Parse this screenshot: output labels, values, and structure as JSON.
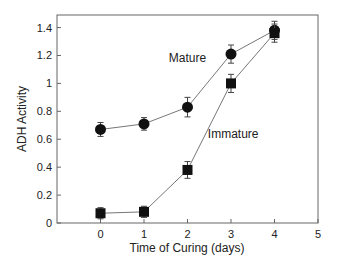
{
  "chart_data": {
    "type": "line",
    "title": "",
    "xlabel": "Time of Curing  (days)",
    "ylabel": "ADH Activity",
    "xlim": [
      -1,
      5
    ],
    "ylim": [
      0,
      1.49
    ],
    "xticks": [
      0,
      1,
      2,
      3,
      4,
      5
    ],
    "xtick_labels": [
      "0",
      "1",
      "2",
      "3",
      "4",
      "5"
    ],
    "yticks": [
      0,
      0.2,
      0.4,
      0.6,
      0.8,
      1,
      1.2,
      1.4
    ],
    "ytick_labels": [
      "0",
      "0.2",
      "0.4",
      "0.6",
      "0.8",
      "1",
      "1.2",
      "1.4"
    ],
    "grid": false,
    "x": [
      0,
      1,
      2,
      3,
      4
    ],
    "series": [
      {
        "name": "Mature",
        "marker": "circle",
        "values": [
          0.67,
          0.71,
          0.83,
          1.21,
          1.38
        ],
        "errors": [
          0.05,
          0.045,
          0.07,
          0.065,
          0.065
        ]
      },
      {
        "name": "Immature",
        "marker": "square",
        "values": [
          0.07,
          0.08,
          0.38,
          1.0,
          1.36
        ],
        "errors": [
          0.04,
          0.04,
          0.06,
          0.065,
          0.065
        ]
      }
    ],
    "annotations": [
      {
        "text": "Mature",
        "x": 2.0,
        "y": 1.15
      },
      {
        "text": "Immature",
        "x": 3.05,
        "y": 0.61
      }
    ],
    "colors": {
      "marker": "#111111",
      "line": "#777777",
      "frame": "#666666"
    }
  }
}
